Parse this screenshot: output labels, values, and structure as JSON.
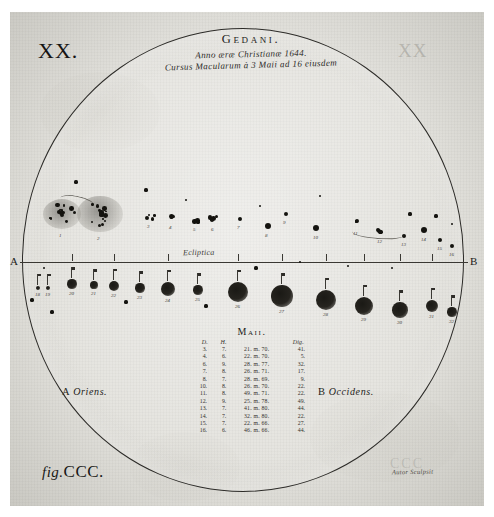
{
  "plate": {
    "number": "XX.",
    "number_ghost": "XX",
    "figure_caption_prefix": "fig.",
    "figure_caption": "CCC.",
    "signature": "Autor Sculpsit",
    "signature_ghost": "CCC"
  },
  "title": {
    "main": "Gedani.",
    "line2": "Anno æræ Christianæ 1644.",
    "line3": "Cursus Macularum à 3 Maii ad 16 eiusdem"
  },
  "diagram": {
    "ecliptic_label": "Ecliptica",
    "endpoint_left": "A",
    "endpoint_right": "B",
    "orient_left": "A Oriens.",
    "orient_left_letter": "A",
    "orient_left_word": "Oriens.",
    "orient_right": "B Occidens.",
    "orient_right_letter": "B",
    "orient_right_word": "Occidens."
  },
  "table": {
    "title": "Maii.",
    "headers": [
      "D.",
      "H.",
      "",
      "Dig."
    ],
    "rows": [
      [
        "3.",
        "7.",
        "21. m. 70.",
        "41."
      ],
      [
        "4.",
        "6.",
        "22. m. 70.",
        "5."
      ],
      [
        "6.",
        "9.",
        "28. m. 77.",
        "32."
      ],
      [
        "7.",
        "8.",
        "26. m. 71.",
        "17."
      ],
      [
        "8.",
        "7.",
        "28. m. 69.",
        "9."
      ],
      [
        "10.",
        "8.",
        "26. m. 70.",
        "22."
      ],
      [
        "11.",
        "8.",
        "49. m. 71.",
        "22."
      ],
      [
        "12.",
        "9.",
        "25. m. 78.",
        "49."
      ],
      [
        "13.",
        "7.",
        "41. m. 80.",
        "44."
      ],
      [
        "14.",
        "7.",
        "32. m. 80.",
        "22."
      ],
      [
        "15.",
        "7.",
        "22. m. 66.",
        "27."
      ],
      [
        "16.",
        "6.",
        "46. m. 66.",
        "44."
      ]
    ]
  },
  "chart_data": {
    "type": "scatter",
    "xlabel": "Ecliptica (A Oriens → B Occidens)",
    "ylabel": "",
    "note": "Sunspot positions traced across the solar disc over successive days",
    "upper_track_labels": [
      "1",
      "2",
      "3",
      "4",
      "5",
      "6",
      "7",
      "8",
      "9",
      "10",
      "11",
      "12",
      "13",
      "14",
      "15",
      "16",
      "17"
    ],
    "lower_track_labels": [
      "18",
      "19",
      "20",
      "21",
      "22",
      "23",
      "24",
      "25",
      "26",
      "27",
      "28",
      "29",
      "30",
      "31",
      "32"
    ],
    "upper_spots": [
      {
        "x": 62,
        "y": 214,
        "r": 16,
        "kind": "cluster",
        "label": "1"
      },
      {
        "x": 100,
        "y": 214,
        "r": 19,
        "kind": "cluster",
        "label": "2"
      },
      {
        "x": 150,
        "y": 216,
        "r": 5,
        "kind": "group",
        "label": "3"
      },
      {
        "x": 172,
        "y": 216,
        "r": 6,
        "kind": "group",
        "label": "4"
      },
      {
        "x": 196,
        "y": 220,
        "r": 4,
        "kind": "group",
        "label": "5"
      },
      {
        "x": 214,
        "y": 219,
        "r": 5,
        "kind": "group",
        "label": "6"
      },
      {
        "x": 240,
        "y": 219,
        "r": 3,
        "kind": "dot",
        "label": "7"
      },
      {
        "x": 268,
        "y": 226,
        "r": 4,
        "kind": "dot",
        "label": "8"
      },
      {
        "x": 286,
        "y": 214,
        "r": 3,
        "kind": "dot",
        "label": "9"
      },
      {
        "x": 316,
        "y": 228,
        "r": 4,
        "kind": "dot",
        "label": "10"
      },
      {
        "x": 356,
        "y": 222,
        "r": 6,
        "kind": "group",
        "label": "11"
      },
      {
        "x": 380,
        "y": 232,
        "r": 4,
        "kind": "group",
        "label": "12"
      },
      {
        "x": 404,
        "y": 236,
        "r": 3,
        "kind": "dot",
        "label": "13"
      },
      {
        "x": 424,
        "y": 230,
        "r": 4,
        "kind": "dot",
        "label": "14"
      },
      {
        "x": 440,
        "y": 240,
        "r": 3,
        "kind": "dot",
        "label": "15"
      },
      {
        "x": 452,
        "y": 246,
        "r": 3,
        "kind": "dot",
        "label": "16"
      }
    ],
    "lower_spots": [
      {
        "x": 38,
        "y": 288,
        "r": 3,
        "label": "18"
      },
      {
        "x": 48,
        "y": 288,
        "r": 3,
        "label": "19"
      },
      {
        "x": 72,
        "y": 284,
        "r": 6,
        "label": "20"
      },
      {
        "x": 94,
        "y": 285,
        "r": 5,
        "label": "21"
      },
      {
        "x": 114,
        "y": 286,
        "r": 7,
        "label": "22"
      },
      {
        "x": 140,
        "y": 288,
        "r": 6,
        "label": "23"
      },
      {
        "x": 168,
        "y": 289,
        "r": 9,
        "label": "24"
      },
      {
        "x": 198,
        "y": 290,
        "r": 6,
        "label": "25"
      },
      {
        "x": 238,
        "y": 292,
        "r": 13,
        "label": "26"
      },
      {
        "x": 282,
        "y": 296,
        "r": 14,
        "label": "27"
      },
      {
        "x": 326,
        "y": 300,
        "r": 13,
        "label": "28"
      },
      {
        "x": 364,
        "y": 306,
        "r": 12,
        "label": "29"
      },
      {
        "x": 400,
        "y": 310,
        "r": 10,
        "label": "30"
      },
      {
        "x": 432,
        "y": 306,
        "r": 8,
        "label": "31"
      },
      {
        "x": 452,
        "y": 312,
        "r": 6,
        "label": "32"
      }
    ]
  },
  "colors": {
    "ink": "#1b1a18",
    "paper": "#e6e5e0",
    "spot": "#14130f",
    "rule": "#3a3833"
  }
}
